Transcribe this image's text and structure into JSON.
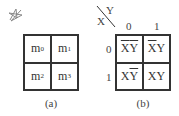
{
  "decorative_mark": "star-scribble",
  "figure_a": {
    "caption": "(a)",
    "cells": [
      {
        "base": "m",
        "sub": "0"
      },
      {
        "base": "m",
        "sub": "1"
      },
      {
        "base": "m",
        "sub": "2"
      },
      {
        "base": "m",
        "sub": "3"
      }
    ]
  },
  "figure_b": {
    "caption": "(b)",
    "col_var": "Y",
    "row_var": "X",
    "col_headers": [
      "0",
      "1"
    ],
    "row_headers": [
      "0",
      "1"
    ],
    "cells": [
      {
        "x": "X",
        "x_bar": true,
        "y": "Y",
        "y_bar": true
      },
      {
        "x": "X",
        "x_bar": true,
        "y": "Y",
        "y_bar": false
      },
      {
        "x": "X",
        "x_bar": false,
        "y": "Y",
        "y_bar": true
      },
      {
        "x": "X",
        "x_bar": false,
        "y": "Y",
        "y_bar": false
      }
    ]
  }
}
